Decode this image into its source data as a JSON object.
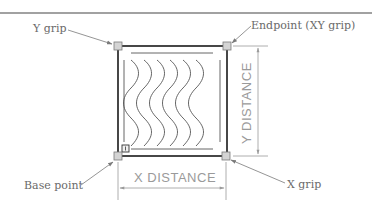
{
  "diagram": {
    "labels": {
      "y_grip": "Y grip",
      "endpoint_xy_grip": "Endpoint (XY grip)",
      "base_point": "Base point",
      "x_grip": "X grip"
    },
    "dimensions": {
      "x_distance": "X  DISTANCE",
      "y_distance": "Y  DISTANCE"
    },
    "colors": {
      "frame": "#1a1a1a",
      "grip_fill": "#d4d4d4",
      "grip_stroke": "#7a7a7a",
      "leader": "#7a7a7a",
      "dimension": "#9a9a9a",
      "label_text": "#6a6a6a",
      "wave": "#555555"
    },
    "grips": [
      "Y grip",
      "Endpoint (XY grip)",
      "Base point",
      "X grip"
    ]
  }
}
